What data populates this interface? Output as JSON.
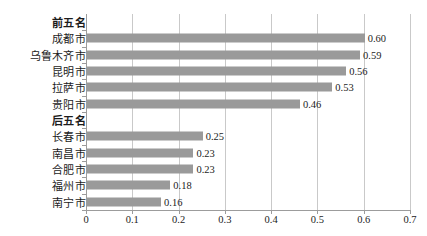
{
  "chart_data": {
    "type": "bar",
    "orientation": "horizontal",
    "title": "",
    "xlabel": "",
    "ylabel": "",
    "xlim": [
      0,
      0.7
    ],
    "xticks": [
      "0",
      "0.1",
      "0.2",
      "0.3",
      "0.4",
      "0.5",
      "0.6",
      "0.7"
    ],
    "xtick_values": [
      0,
      0.1,
      0.2,
      0.3,
      0.4,
      0.5,
      0.6,
      0.7
    ],
    "grid": "vertical",
    "legend": "none",
    "bar_color": "#9a9a9a",
    "groups": [
      {
        "label": "前五名"
      },
      {
        "label": "后五名"
      }
    ],
    "categories": [
      "前五名",
      "成都市",
      "乌鲁木齐市",
      "昆明市",
      "拉萨市",
      "贵阳市",
      "后五名",
      "长春市",
      "南昌市",
      "合肥市",
      "福州市",
      "南宁市"
    ],
    "rows": [
      {
        "label": "前五名",
        "value": null,
        "value_label": "",
        "is_group_header": true
      },
      {
        "label": "成都市",
        "value": 0.6,
        "value_label": "0.60",
        "is_group_header": false
      },
      {
        "label": "乌鲁木齐市",
        "value": 0.59,
        "value_label": "0.59",
        "is_group_header": false
      },
      {
        "label": "昆明市",
        "value": 0.56,
        "value_label": "0.56",
        "is_group_header": false
      },
      {
        "label": "拉萨市",
        "value": 0.53,
        "value_label": "0.53",
        "is_group_header": false
      },
      {
        "label": "贵阳市",
        "value": 0.46,
        "value_label": "0.46",
        "is_group_header": false
      },
      {
        "label": "后五名",
        "value": null,
        "value_label": "",
        "is_group_header": true
      },
      {
        "label": "长春市",
        "value": 0.25,
        "value_label": "0.25",
        "is_group_header": false
      },
      {
        "label": "南昌市",
        "value": 0.23,
        "value_label": "0.23",
        "is_group_header": false
      },
      {
        "label": "合肥市",
        "value": 0.23,
        "value_label": "0.23",
        "is_group_header": false
      },
      {
        "label": "福州市",
        "value": 0.18,
        "value_label": "0.18",
        "is_group_header": false
      },
      {
        "label": "南宁市",
        "value": 0.16,
        "value_label": "0.16",
        "is_group_header": false
      }
    ],
    "values": [
      null,
      0.6,
      0.59,
      0.56,
      0.53,
      0.46,
      null,
      0.25,
      0.23,
      0.23,
      0.18,
      0.16
    ]
  }
}
